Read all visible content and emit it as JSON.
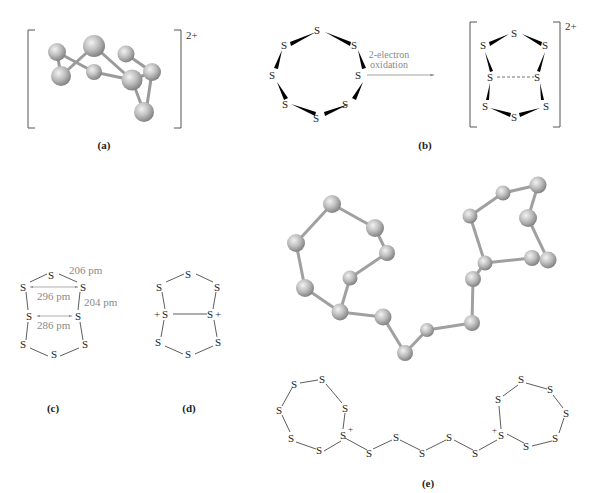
{
  "panels": {
    "a": {
      "caption": "(a)",
      "charge": "2+",
      "description": "3D ball-and-stick model of S8 2+ cation"
    },
    "b": {
      "caption": "(b)",
      "reactant_atoms": [
        "S",
        "S",
        "S",
        "S",
        "S",
        "S",
        "S",
        "S"
      ],
      "arrow_label_line1": "2-electron",
      "arrow_label_line2": "oxidation",
      "product_atoms": [
        "S",
        "S",
        "S",
        "S",
        "S",
        "S",
        "S",
        "S"
      ],
      "product_charge": "2+"
    },
    "c": {
      "caption": "(c)",
      "atom": "S",
      "distances": {
        "bond_top": "206 pm",
        "cross_upper": "296 pm",
        "bond_side": "204 pm",
        "cross_lower": "286 pm"
      }
    },
    "d": {
      "caption": "(d)",
      "atom": "S",
      "plus": "+"
    },
    "e": {
      "caption": "(e)",
      "atom": "S",
      "plus": "+",
      "description": "3D ball-and-stick model and structural formula of S19 2+ cation"
    }
  },
  "colors": {
    "text": "#222222",
    "gray_text": "#8a8a8a",
    "ball": "#b8b8b8",
    "bracket": "#555555"
  }
}
